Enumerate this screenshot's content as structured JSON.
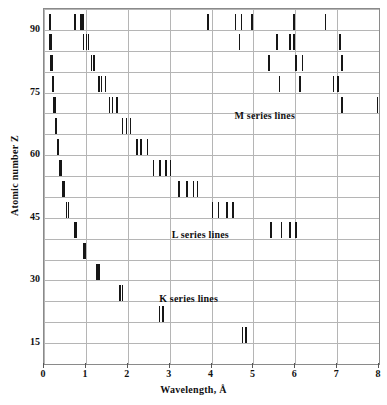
{
  "chart_data": {
    "type": "scatter",
    "title": "",
    "subtitle": "",
    "xlabel": "Wavelength, Å",
    "ylabel": "Atomic number Z",
    "xlim": [
      0,
      8
    ],
    "ylim": [
      10,
      95
    ],
    "grid": true,
    "grid_x_step": 1,
    "grid_y_step": 5,
    "xticks": [
      0,
      1,
      2,
      3,
      4,
      5,
      6,
      7,
      8
    ],
    "xtick_labels": [
      "0",
      "1",
      "2",
      "3",
      "4",
      "5",
      "6",
      "7",
      "8"
    ],
    "yticks": [
      15,
      30,
      45,
      60,
      75,
      90
    ],
    "ytick_labels": [
      "15",
      "30",
      "45",
      "60",
      "75",
      "90"
    ],
    "legend_position": "inside-annotations",
    "annotations": [
      {
        "text": "M series lines",
        "x": 4.55,
        "y": 69.5
      },
      {
        "text": "L series lines",
        "x": 3.05,
        "y": 41.0
      },
      {
        "text": "K series lines",
        "x": 2.75,
        "y": 25.5
      }
    ],
    "series": [
      {
        "name": "K series lines",
        "description": "K emission lines, wavelength decreasing with atomic number Z",
        "marker": "vertical-tick",
        "points": [
          {
            "z": 92,
            "wavelengths": [
              0.11,
              0.13
            ]
          },
          {
            "z": 87,
            "wavelengths": [
              0.13,
              0.15
            ]
          },
          {
            "z": 82,
            "wavelengths": [
              0.15,
              0.17
            ]
          },
          {
            "z": 77,
            "wavelengths": [
              0.18,
              0.2
            ]
          },
          {
            "z": 72,
            "wavelengths": [
              0.21,
              0.24
            ]
          },
          {
            "z": 67,
            "wavelengths": [
              0.25,
              0.28
            ]
          },
          {
            "z": 62,
            "wavelengths": [
              0.3,
              0.33
            ]
          },
          {
            "z": 57,
            "wavelengths": [
              0.36,
              0.39
            ]
          },
          {
            "z": 52,
            "wavelengths": [
              0.43,
              0.47
            ]
          },
          {
            "z": 47,
            "wavelengths": [
              0.52,
              0.56
            ]
          },
          {
            "z": 42,
            "wavelengths": [
              0.71,
              0.74
            ]
          },
          {
            "z": 37,
            "wavelengths": [
              0.92,
              0.96
            ]
          },
          {
            "z": 32,
            "wavelengths": [
              1.25,
              1.3
            ]
          },
          {
            "z": 27,
            "wavelengths": [
              1.79,
              1.85
            ]
          },
          {
            "z": 22,
            "wavelengths": [
              2.74,
              2.82
            ]
          },
          {
            "z": 17,
            "wavelengths": [
              4.72,
              4.8
            ]
          }
        ]
      },
      {
        "name": "L series lines",
        "description": "L emission lines, longer wavelengths than K at same Z",
        "marker": "vertical-tick",
        "points": [
          {
            "z": 92,
            "wavelengths": [
              0.72,
              0.87,
              0.91
            ]
          },
          {
            "z": 87,
            "wavelengths": [
              0.93,
              1.0,
              1.04
            ]
          },
          {
            "z": 82,
            "wavelengths": [
              1.12,
              1.18
            ]
          },
          {
            "z": 77,
            "wavelengths": [
              1.3,
              1.35,
              1.45
            ]
          },
          {
            "z": 72,
            "wavelengths": [
              1.55,
              1.62,
              1.72
            ]
          },
          {
            "z": 67,
            "wavelengths": [
              1.85,
              1.95,
              2.05
            ]
          },
          {
            "z": 62,
            "wavelengths": [
              2.2,
              2.3,
              2.45
            ]
          },
          {
            "z": 57,
            "wavelengths": [
              2.6,
              2.75,
              2.9,
              3.0
            ]
          },
          {
            "z": 52,
            "wavelengths": [
              3.2,
              3.4,
              3.55,
              3.65
            ]
          },
          {
            "z": 47,
            "wavelengths": [
              4.0,
              4.15,
              4.35,
              4.5
            ]
          },
          {
            "z": 42,
            "wavelengths": [
              5.4,
              5.65,
              5.85,
              6.0
            ]
          }
        ]
      },
      {
        "name": "M series lines",
        "description": "M emission lines, longest wavelengths, only for heavy elements",
        "marker": "vertical-tick",
        "points": [
          {
            "z": 92,
            "wavelengths": [
              3.9,
              4.55,
              4.7,
              4.95,
              5.95,
              6.7
            ]
          },
          {
            "z": 87,
            "wavelengths": [
              4.65,
              5.55,
              5.85,
              5.95,
              7.05
            ]
          },
          {
            "z": 82,
            "wavelengths": [
              5.35,
              6.0,
              6.15,
              7.1
            ]
          },
          {
            "z": 77,
            "wavelengths": [
              5.6,
              6.1,
              6.9,
              7.0
            ]
          },
          {
            "z": 72,
            "wavelengths": [
              7.1,
              7.95
            ]
          }
        ]
      }
    ]
  }
}
